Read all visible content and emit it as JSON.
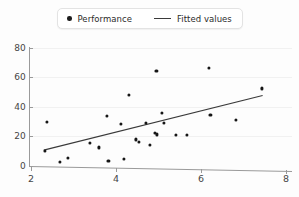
{
  "chart_data": {
    "type": "scatter",
    "title": "",
    "xlabel": "",
    "ylabel": "",
    "xlim": [
      2.0,
      8.0
    ],
    "ylim": [
      0,
      80
    ],
    "xticks": [
      2,
      4,
      6,
      8
    ],
    "yticks": [
      0,
      20,
      40,
      60,
      80
    ],
    "grid": true,
    "legend_position": "top-center",
    "legend": [
      {
        "label": "Performance",
        "marker": "dot",
        "color": "#161616"
      },
      {
        "label": "Fitted values",
        "marker": "line",
        "color": "#3a3a3a"
      }
    ],
    "series": [
      {
        "name": "Performance",
        "marker": "dot",
        "color": "#161616",
        "points": [
          {
            "x": 2.32,
            "y": 10.5
          },
          {
            "x": 2.38,
            "y": 29.8
          },
          {
            "x": 2.68,
            "y": 3.0
          },
          {
            "x": 2.86,
            "y": 5.4
          },
          {
            "x": 3.38,
            "y": 15.6
          },
          {
            "x": 3.6,
            "y": 12.6
          },
          {
            "x": 3.78,
            "y": 34.2
          },
          {
            "x": 3.82,
            "y": 3.2
          },
          {
            "x": 4.12,
            "y": 28.7
          },
          {
            "x": 4.18,
            "y": 4.6
          },
          {
            "x": 4.3,
            "y": 48.3
          },
          {
            "x": 4.46,
            "y": 18.0
          },
          {
            "x": 4.54,
            "y": 16.6
          },
          {
            "x": 4.7,
            "y": 29.2
          },
          {
            "x": 4.8,
            "y": 14.2
          },
          {
            "x": 4.92,
            "y": 22.6
          },
          {
            "x": 4.95,
            "y": 64.2
          },
          {
            "x": 4.96,
            "y": 21.4
          },
          {
            "x": 5.08,
            "y": 36.2
          },
          {
            "x": 5.12,
            "y": 29.4
          },
          {
            "x": 5.4,
            "y": 21.2
          },
          {
            "x": 5.66,
            "y": 20.9
          },
          {
            "x": 6.18,
            "y": 66.4
          },
          {
            "x": 6.22,
            "y": 34.4
          },
          {
            "x": 6.82,
            "y": 31.5
          },
          {
            "x": 7.44,
            "y": 52.6
          }
        ]
      },
      {
        "name": "Fitted values",
        "type": "line",
        "color": "#3a3a3a",
        "endpoints": [
          {
            "x": 2.3,
            "y": 10.8
          },
          {
            "x": 7.45,
            "y": 47.8
          }
        ]
      }
    ]
  },
  "axis": {
    "ytick_labels": [
      "80",
      "60",
      "40",
      "20",
      "0"
    ],
    "xtick_labels": [
      "2",
      "4",
      "6",
      "8"
    ]
  }
}
